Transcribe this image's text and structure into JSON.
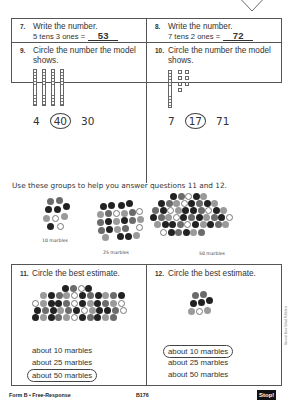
{
  "page_badge": {
    "label": "PAGE 2"
  },
  "questions": {
    "q7": {
      "number": "7.",
      "prompt": "Write the number.",
      "expression": "5 tens 3 ones =",
      "answer": "53"
    },
    "q8": {
      "number": "8.",
      "prompt": "Write the number.",
      "expression": "7 tens 2 ones =",
      "answer": "72"
    },
    "q9": {
      "number": "9.",
      "prompt_line1": "Circle the number the model",
      "prompt_line2": "shows.",
      "model": {
        "tens_rods": 4,
        "ones_cubes": 0
      },
      "choices": [
        "4",
        "40",
        "30"
      ],
      "circled_index": 1
    },
    "q10": {
      "number": "10.",
      "prompt_line1": "Circle the number the model",
      "prompt_line2": "shows.",
      "model": {
        "tens_rods": 1,
        "ones_cubes": 7
      },
      "choices": [
        "7",
        "17",
        "71"
      ],
      "circled_index": 1
    },
    "q11": {
      "number": "11.",
      "prompt": "Circle the best estimate.",
      "options": [
        "about 10 marbles",
        "about 25 marbles",
        "about 50 marbles"
      ],
      "circled_index": 2
    },
    "q12": {
      "number": "12.",
      "prompt": "Circle the best estimate.",
      "options": [
        "about 10 marbles",
        "about 25 marbles",
        "about 50 marbles"
      ],
      "circled_index": 0
    }
  },
  "reference": {
    "instruction": "Use these groups to help you answer questions 11 and 12.",
    "groups": [
      {
        "label": "10 marbles"
      },
      {
        "label": "25 marbles"
      },
      {
        "label": "50 marbles"
      }
    ]
  },
  "side_credit": "Harcourt Brace School Publishers",
  "footer": {
    "form": "Form B • Free-Response",
    "code": "B176",
    "stop": "Stop!"
  }
}
